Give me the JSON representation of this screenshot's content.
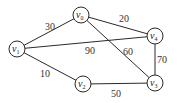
{
  "graph": {
    "nodes": [
      {
        "id": "v0",
        "base": "v",
        "sub": "0"
      },
      {
        "id": "v1",
        "base": "v",
        "sub": "1"
      },
      {
        "id": "v2",
        "base": "v",
        "sub": "2"
      },
      {
        "id": "v3",
        "base": "v",
        "sub": "3"
      },
      {
        "id": "v4",
        "base": "v",
        "sub": "4"
      }
    ],
    "edges": [
      {
        "from": "v1",
        "to": "v0",
        "weight": "30"
      },
      {
        "from": "v0",
        "to": "v4",
        "weight": "20"
      },
      {
        "from": "v1",
        "to": "v4",
        "weight": "90"
      },
      {
        "from": "v0",
        "to": "v3",
        "weight": "60"
      },
      {
        "from": "v4",
        "to": "v3",
        "weight": "70"
      },
      {
        "from": "v1",
        "to": "v2",
        "weight": "10"
      },
      {
        "from": "v2",
        "to": "v3",
        "weight": "50"
      }
    ]
  }
}
